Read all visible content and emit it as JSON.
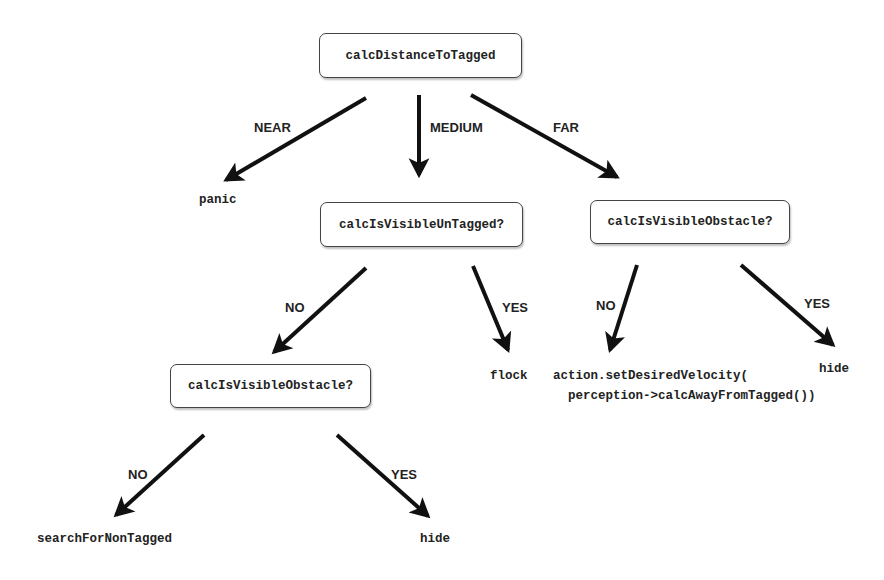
{
  "diagram": {
    "type": "decision-tree",
    "nodes": {
      "root": "calcDistanceToTagged",
      "medium_check": "calcIsVisibleUnTagged?",
      "far_check": "calcIsVisibleObstacle?",
      "medium_no_check": "calcIsVisibleObstacle?"
    },
    "leaves": {
      "panic": "panic",
      "flock": "flock",
      "far_no_line1": "action.setDesiredVelocity(",
      "far_no_line2": "perception->calcAwayFromTagged())",
      "far_yes": "hide",
      "search": "searchForNonTagged",
      "medium_no_yes": "hide"
    },
    "edge_labels": {
      "near": "NEAR",
      "medium": "MEDIUM",
      "far": "FAR",
      "medium_no": "NO",
      "medium_yes": "YES",
      "far_no": "NO",
      "far_yes": "YES",
      "obstacle_no": "NO",
      "obstacle_yes": "YES"
    },
    "colors": {
      "stroke": "#111111",
      "box_border": "#444444",
      "text": "#222222"
    }
  }
}
